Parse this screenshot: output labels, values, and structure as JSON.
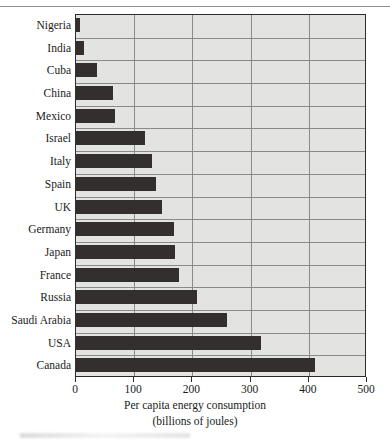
{
  "chart_data": {
    "type": "bar",
    "orientation": "horizontal",
    "title": "",
    "xlabel": "Per capita energy consumption (billions of joules)",
    "xlabel_line1": "Per capita energy consumption",
    "xlabel_line2": "(billions of joules)",
    "ylabel": "",
    "xlim": [
      0,
      500
    ],
    "xticks": [
      0,
      100,
      200,
      300,
      400,
      500
    ],
    "xtick_labels": [
      "0",
      "100",
      "200",
      "300",
      "400",
      "500"
    ],
    "grid": true,
    "grid_axis": "x",
    "legend": false,
    "bar_color": "#332f2f",
    "plot_background": "#e3e3e1",
    "categories": [
      "Nigeria",
      "India",
      "Cuba",
      "China",
      "Mexico",
      "Israel",
      "Italy",
      "Spain",
      "UK",
      "Germany",
      "Japan",
      "France",
      "Russia",
      "Saudi Arabia",
      "USA",
      "Canada"
    ],
    "values": [
      8,
      15,
      38,
      65,
      68,
      120,
      133,
      140,
      150,
      170,
      172,
      178,
      210,
      262,
      320,
      413
    ]
  }
}
